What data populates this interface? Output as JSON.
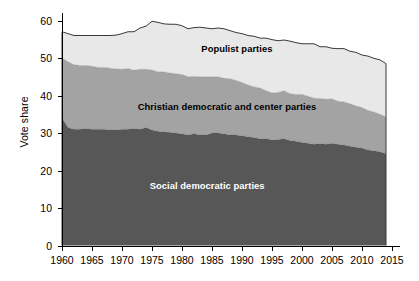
{
  "chart_data": {
    "type": "area",
    "stacked": true,
    "title": "",
    "xlabel": "",
    "ylabel": "Vote share",
    "xlim": [
      1960,
      2015
    ],
    "ylim": [
      0,
      62
    ],
    "xticks": [
      1960,
      1965,
      1970,
      1975,
      1980,
      1985,
      1990,
      1995,
      2000,
      2005,
      2010,
      2015
    ],
    "yticks": [
      0,
      10,
      20,
      30,
      40,
      50,
      60
    ],
    "grid": false,
    "legend_position": "in-plot-annotations",
    "x": [
      1960,
      1961,
      1962,
      1963,
      1964,
      1965,
      1966,
      1967,
      1968,
      1969,
      1970,
      1971,
      1972,
      1973,
      1974,
      1975,
      1976,
      1977,
      1978,
      1979,
      1980,
      1981,
      1982,
      1983,
      1984,
      1985,
      1986,
      1987,
      1988,
      1989,
      1990,
      1991,
      1992,
      1993,
      1994,
      1995,
      1996,
      1997,
      1998,
      1999,
      2000,
      2001,
      2002,
      2003,
      2004,
      2005,
      2006,
      2007,
      2008,
      2009,
      2010,
      2011,
      2012,
      2013,
      2014
    ],
    "series": [
      {
        "name": "Social democratic parties",
        "color": "#575757",
        "values": [
          34.0,
          31.5,
          31.0,
          31.0,
          31.2,
          31.0,
          31.0,
          31.0,
          30.8,
          30.8,
          31.0,
          31.0,
          31.2,
          31.0,
          31.5,
          30.8,
          30.5,
          30.3,
          30.2,
          30.0,
          29.8,
          29.5,
          29.8,
          29.5,
          29.5,
          30.0,
          30.0,
          29.8,
          29.5,
          29.5,
          29.3,
          29.0,
          28.8,
          28.5,
          28.5,
          28.2,
          28.3,
          28.5,
          28.0,
          27.8,
          27.5,
          27.3,
          27.0,
          27.2,
          27.0,
          27.3,
          27.0,
          26.8,
          26.5,
          26.2,
          26.0,
          25.5,
          25.3,
          25.0,
          24.5
        ]
      },
      {
        "name": "Christian democratic and center parties",
        "color": "#a3a3a3",
        "values": [
          16.0,
          17.5,
          17.2,
          17.0,
          16.8,
          16.8,
          16.5,
          16.5,
          16.5,
          16.3,
          16.0,
          16.2,
          15.5,
          16.0,
          15.5,
          16.0,
          15.8,
          16.0,
          15.8,
          15.8,
          15.8,
          15.5,
          15.3,
          15.5,
          15.5,
          15.0,
          15.0,
          14.8,
          15.0,
          14.5,
          14.2,
          13.8,
          13.5,
          13.5,
          12.8,
          12.5,
          12.5,
          12.8,
          12.5,
          12.5,
          12.8,
          12.5,
          12.3,
          12.0,
          12.0,
          11.8,
          11.5,
          11.5,
          11.3,
          11.0,
          10.8,
          10.5,
          10.3,
          10.0,
          9.8
        ]
      },
      {
        "name": "Populist parties",
        "color": "#e8e8e8",
        "values": [
          7.0,
          7.5,
          7.8,
          8.0,
          8.0,
          8.2,
          8.5,
          8.5,
          8.7,
          9.0,
          9.5,
          9.8,
          10.3,
          11.0,
          11.5,
          13.0,
          13.2,
          12.8,
          13.0,
          13.2,
          13.0,
          12.8,
          13.0,
          13.2,
          13.0,
          12.8,
          13.0,
          13.2,
          12.8,
          12.8,
          13.0,
          13.2,
          13.5,
          13.3,
          14.0,
          14.2,
          13.8,
          13.5,
          14.0,
          13.8,
          13.5,
          14.0,
          14.5,
          13.8,
          14.0,
          13.5,
          14.0,
          14.2,
          14.0,
          14.3,
          14.0,
          14.5,
          14.3,
          14.5,
          14.2
        ]
      }
    ],
    "annotations": [
      {
        "text": "Populist parties",
        "x_frac": 0.53,
        "y_value": 52.5,
        "style": "dark-on-light"
      },
      {
        "text": "Christian democratic and center parties",
        "x_frac": 0.5,
        "y_value": 37.0,
        "style": "dark-on-light"
      },
      {
        "text": "Social democratic parties",
        "x_frac": 0.44,
        "y_value": 16.0,
        "style": "light-on-dark"
      }
    ]
  },
  "axis": {
    "y_title": "Vote share",
    "y_tick_labels": [
      "60",
      "50",
      "40",
      "30",
      "20",
      "10",
      "0"
    ],
    "x_tick_labels": [
      "1960",
      "1965",
      "1970",
      "1975",
      "1980",
      "1985",
      "1990",
      "1995",
      "2000",
      "2005",
      "2010",
      "2015"
    ]
  },
  "labels": {
    "populist": "Populist parties",
    "christian": "Christian democratic and center parties",
    "social": "Social democratic parties"
  },
  "colors": {
    "social": "#575757",
    "christian": "#a3a3a3",
    "populist": "#e8e8e8",
    "line": "#3a3a3a",
    "axis": "#000000",
    "background": "#ffffff"
  }
}
